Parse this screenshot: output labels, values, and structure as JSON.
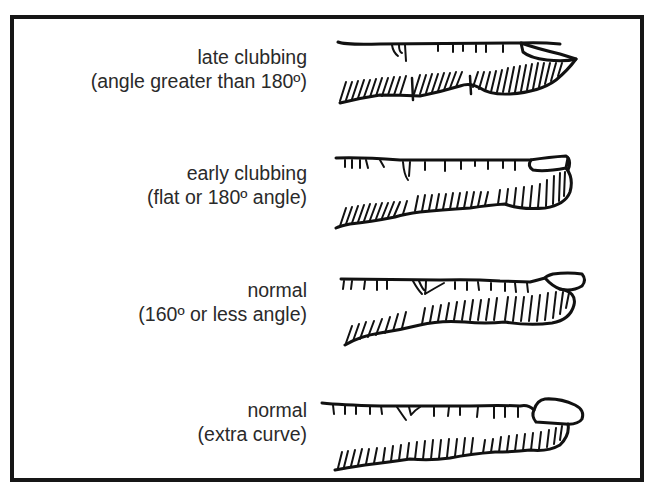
{
  "figure": {
    "rows": [
      {
        "id": "late-clubbing",
        "title": "late clubbing",
        "subtitle": "(angle greater than 180º)"
      },
      {
        "id": "early-clubbing",
        "title": "early clubbing",
        "subtitle": "(flat or 180º angle)"
      },
      {
        "id": "normal-160",
        "title": "normal",
        "subtitle": "(160º or less angle)"
      },
      {
        "id": "normal-extra-curve",
        "title": "normal",
        "subtitle": "(extra curve)"
      }
    ]
  },
  "colors": {
    "ink": "#111111",
    "text": "#2a2a2a",
    "background": "#ffffff",
    "border": "#161616"
  }
}
